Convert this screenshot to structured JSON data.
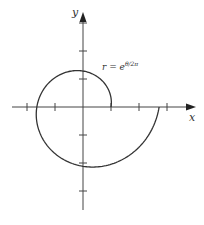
{
  "chart_data": {
    "type": "line",
    "subtype": "polar-curve",
    "title": "",
    "equation_label": "r = e^(θ/2π)",
    "equation_base": "r = e",
    "equation_exponent": "θ/2π",
    "xlabel": "x",
    "ylabel": "y",
    "theta_range": [
      0,
      6.2832
    ],
    "x_ticks": [
      -3,
      -2,
      -1,
      1,
      2,
      3
    ],
    "y_ticks": [
      -3,
      -2,
      -1,
      1,
      2,
      3
    ],
    "tick_labels_shown": false,
    "grid": false,
    "points": [
      {
        "theta": 0,
        "r": 1.0,
        "x": 1.0,
        "y": 0.0
      },
      {
        "theta": 1.5708,
        "r": 1.284,
        "x": 0.0,
        "y": 1.284
      },
      {
        "theta": 3.1416,
        "r": 1.649,
        "x": -1.649,
        "y": 0.0
      },
      {
        "theta": 4.7124,
        "r": 2.117,
        "x": 0.0,
        "y": -2.117
      },
      {
        "theta": 6.2832,
        "r": 2.718,
        "x": 2.718,
        "y": 0.0
      }
    ],
    "line_color": "#333333"
  }
}
